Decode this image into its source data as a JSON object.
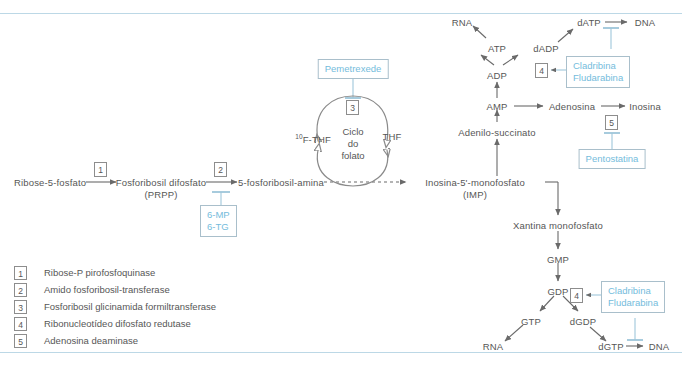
{
  "diagram": {
    "accent_rule_color": "#bcd8e6",
    "drug_text_color": "#74bcdc",
    "label_color": "#565656"
  },
  "nodes": {
    "ribose5p": "Ribose-5-fosfato",
    "prpp_line1": "Fosforibosil difosfato",
    "prpp_line2": "(PRPP)",
    "fosforibosilamina": "5-fosforibosil-amina",
    "imp_line1": "Inosina-5'-monofosfato",
    "imp_line2": "(IMP)",
    "xantina": "Xantina monofosfato",
    "adenilosuccinato": "Adenilo-succinato",
    "amp": "AMP",
    "adenosina": "Adenosina",
    "inosina": "Inosina",
    "adp": "ADP",
    "atp": "ATP",
    "dadp": "dADP",
    "datp": "dATP",
    "dna_top": "DNA",
    "rna_top": "RNA",
    "gmp": "GMP",
    "gdp": "GDP",
    "gtp": "GTP",
    "dgdp": "dGDP",
    "dgtp": "dGTP",
    "dna_bottom": "DNA",
    "rna_bottom": "RNA",
    "f_thf_sup": "10",
    "f_thf": "F-THF",
    "thf": "THF",
    "cycle_line1": "Ciclo",
    "cycle_line2": "do",
    "cycle_line3": "folato"
  },
  "enzyme_markers": {
    "e1": "1",
    "e2": "2",
    "e3": "3",
    "e4_top": "4",
    "e4_bottom": "4",
    "e5": "5"
  },
  "drugs": {
    "pemetrexede": "Pemetrexede",
    "mp_tg_line1": "6-MP",
    "mp_tg_line2": "6-TG",
    "cladribina_top_line1": "Cladribina",
    "cladribina_top_line2": "Fludarabina",
    "pentostatina": "Pentostatina",
    "cladribina_bottom_line1": "Cladribina",
    "cladribina_bottom_line2": "Fludarabina"
  },
  "legend": {
    "items": [
      {
        "num": "1",
        "label": "Ribose-P pirofosfoquinase"
      },
      {
        "num": "2",
        "label": "Amido fosforibosil-transferase"
      },
      {
        "num": "3",
        "label": "Fosforibosil glicinamida formiltransferase"
      },
      {
        "num": "4",
        "label": "Ribonucleotídeo difosfato redutase"
      },
      {
        "num": "5",
        "label": "Adenosina deaminase"
      }
    ]
  }
}
